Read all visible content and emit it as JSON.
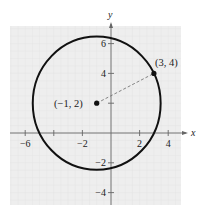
{
  "chart_data": {
    "type": "scatter",
    "title": "",
    "xlabel": "x",
    "ylabel": "y",
    "xlim": [
      -7,
      5
    ],
    "ylim": [
      -5,
      7.5
    ],
    "grid": true,
    "x_ticks": [
      -6,
      -4,
      -2,
      2,
      4
    ],
    "x_tick_labels": [
      "−6",
      "",
      "−2",
      "2",
      "4"
    ],
    "y_ticks": [
      -4,
      -2,
      2,
      4,
      6
    ],
    "y_tick_labels": [
      "−4",
      "−2",
      "",
      "4",
      "6"
    ],
    "circle": {
      "center": [
        -1,
        2
      ],
      "radius": 4.472
    },
    "points": [
      {
        "x": -1,
        "y": 2,
        "label": "(−1, 2)"
      },
      {
        "x": 3,
        "y": 4,
        "label": "(3, 4)"
      }
    ],
    "segments": [
      {
        "from": [
          -1,
          2
        ],
        "to": [
          3,
          4
        ],
        "style": "dashed"
      }
    ]
  },
  "colors": {
    "background": "#ffffff",
    "plot_area": "#eeeeee",
    "grid": "#e2e2e2",
    "axis": "#666666",
    "curve": "#111111",
    "dashed": "#777777"
  }
}
